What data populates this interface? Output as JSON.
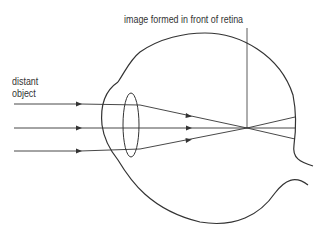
{
  "diagram": {
    "type": "myopia eye ray diagram",
    "labels": {
      "image_position": "image formed in front of retina",
      "object_line1": "distant",
      "object_line2": "object"
    },
    "rays_count": 3,
    "colors": {
      "stroke": "#333333",
      "text": "#333333",
      "background": "#ffffff"
    }
  }
}
